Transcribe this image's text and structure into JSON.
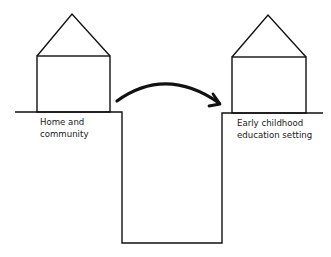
{
  "diagram": {
    "left_setting": {
      "label_line1": "Home and",
      "label_line2": "community"
    },
    "right_setting": {
      "label_line1": "Early childhood",
      "label_line2": "education setting"
    },
    "transition_arrow": "arrow-right-curved",
    "gap": "transition-gap"
  },
  "colors": {
    "stroke": "#111111",
    "background": "#ffffff"
  }
}
